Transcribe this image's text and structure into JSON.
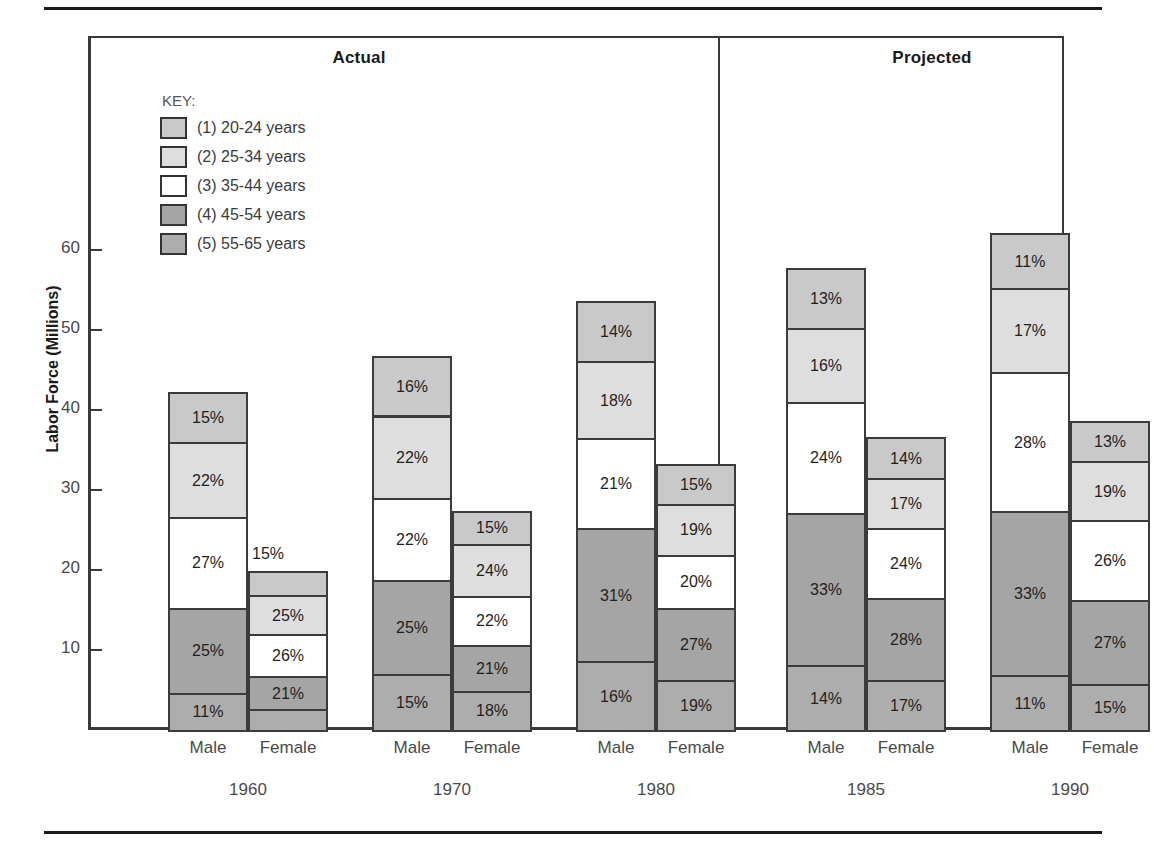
{
  "figure": {
    "rules": {
      "top": true,
      "bottom": true
    },
    "sections": [
      {
        "id": "actual",
        "label": "Actual"
      },
      {
        "id": "projected",
        "label": "Projected"
      }
    ],
    "legend_title": "KEY:"
  },
  "chart_data": {
    "type": "bar",
    "subtype": "stacked-bar-grouped",
    "title": "",
    "xlabel": "",
    "ylabel": "Labor Force (Millions)",
    "ylim": [
      0,
      68
    ],
    "yticks": [
      10,
      20,
      30,
      40,
      50,
      60
    ],
    "ytick_labels": [
      "10",
      "20",
      "30",
      "40",
      "50",
      "60"
    ],
    "grid": false,
    "legend_position": "upper-left-inside",
    "value_format": "percent-of-bar",
    "series": [
      {
        "key": "1",
        "name": "(1) 20-24 years",
        "color": "#c9c9c9"
      },
      {
        "key": "2",
        "name": "(2) 25-34 years",
        "color": "#dedede"
      },
      {
        "key": "3",
        "name": "(3) 35-44 years",
        "color": "#ffffff"
      },
      {
        "key": "4",
        "name": "(4) 45-54 years",
        "color": "#a5a5a5"
      },
      {
        "key": "5",
        "name": "(5) 55-65 years",
        "color": "#adadad"
      }
    ],
    "groups": [
      {
        "year": "1960",
        "section": "actual",
        "bars": [
          {
            "gender": "Male",
            "total": 42.3,
            "segments": [
              {
                "series": "5",
                "label": "11%",
                "value": 11
              },
              {
                "series": "4",
                "label": "25%",
                "value": 25
              },
              {
                "series": "3",
                "label": "27%",
                "value": 27
              },
              {
                "series": "2",
                "label": "22%",
                "value": 22
              },
              {
                "series": "1",
                "label": "15%",
                "value": 15
              }
            ]
          },
          {
            "gender": "Female",
            "total": 19.9,
            "segments": [
              {
                "series": "5",
                "label": "13%",
                "value": 13
              },
              {
                "series": "4",
                "label": "21%",
                "value": 21
              },
              {
                "series": "3",
                "label": "26%",
                "value": 26
              },
              {
                "series": "2",
                "label": "25%",
                "value": 25
              },
              {
                "series": "1",
                "label": "15%",
                "value": 15,
                "callout": true
              }
            ]
          }
        ]
      },
      {
        "year": "1970",
        "section": "actual",
        "bars": [
          {
            "gender": "Male",
            "total": 46.8,
            "segments": [
              {
                "series": "5",
                "label": "15%",
                "value": 15
              },
              {
                "series": "4",
                "label": "25%",
                "value": 25
              },
              {
                "series": "3",
                "label": "22%",
                "value": 22
              },
              {
                "series": "2",
                "label": "22%",
                "value": 22
              },
              {
                "series": "1",
                "label": "16%",
                "value": 16
              }
            ]
          },
          {
            "gender": "Female",
            "total": 27.4,
            "segments": [
              {
                "series": "5",
                "label": "18%",
                "value": 18
              },
              {
                "series": "4",
                "label": "21%",
                "value": 21
              },
              {
                "series": "3",
                "label": "22%",
                "value": 22
              },
              {
                "series": "2",
                "label": "24%",
                "value": 24
              },
              {
                "series": "1",
                "label": "15%",
                "value": 15
              }
            ]
          }
        ]
      },
      {
        "year": "1980",
        "section": "actual",
        "bars": [
          {
            "gender": "Male",
            "total": 53.6,
            "segments": [
              {
                "series": "5",
                "label": "16%",
                "value": 16
              },
              {
                "series": "4",
                "label": "31%",
                "value": 31
              },
              {
                "series": "3",
                "label": "21%",
                "value": 21
              },
              {
                "series": "2",
                "label": "18%",
                "value": 18
              },
              {
                "series": "1",
                "label": "14%",
                "value": 14
              }
            ]
          },
          {
            "gender": "Female",
            "total": 33.2,
            "segments": [
              {
                "series": "5",
                "label": "19%",
                "value": 19
              },
              {
                "series": "4",
                "label": "27%",
                "value": 27
              },
              {
                "series": "3",
                "label": "20%",
                "value": 20
              },
              {
                "series": "2",
                "label": "19%",
                "value": 19
              },
              {
                "series": "1",
                "label": "15%",
                "value": 15
              }
            ]
          }
        ]
      },
      {
        "year": "1985",
        "section": "projected",
        "bars": [
          {
            "gender": "Male",
            "total": 57.8,
            "segments": [
              {
                "series": "5",
                "label": "14%",
                "value": 14
              },
              {
                "series": "4",
                "label": "33%",
                "value": 33
              },
              {
                "series": "3",
                "label": "24%",
                "value": 24
              },
              {
                "series": "2",
                "label": "16%",
                "value": 16
              },
              {
                "series": "1",
                "label": "13%",
                "value": 13
              }
            ]
          },
          {
            "gender": "Female",
            "total": 36.6,
            "segments": [
              {
                "series": "5",
                "label": "17%",
                "value": 17
              },
              {
                "series": "4",
                "label": "28%",
                "value": 28
              },
              {
                "series": "3",
                "label": "24%",
                "value": 24
              },
              {
                "series": "2",
                "label": "17%",
                "value": 17
              },
              {
                "series": "1",
                "label": "14%",
                "value": 14
              }
            ]
          }
        ]
      },
      {
        "year": "1990",
        "section": "projected",
        "bars": [
          {
            "gender": "Male",
            "total": 62.1,
            "segments": [
              {
                "series": "5",
                "label": "11%",
                "value": 11
              },
              {
                "series": "4",
                "label": "33%",
                "value": 33
              },
              {
                "series": "3",
                "label": "28%",
                "value": 28
              },
              {
                "series": "2",
                "label": "17%",
                "value": 17
              },
              {
                "series": "1",
                "label": "11%",
                "value": 11
              }
            ]
          },
          {
            "gender": "Female",
            "total": 38.6,
            "segments": [
              {
                "series": "5",
                "label": "15%",
                "value": 15
              },
              {
                "series": "4",
                "label": "27%",
                "value": 27
              },
              {
                "series": "3",
                "label": "26%",
                "value": 26
              },
              {
                "series": "2",
                "label": "19%",
                "value": 19
              },
              {
                "series": "1",
                "label": "13%",
                "value": 13
              }
            ]
          }
        ]
      }
    ]
  }
}
